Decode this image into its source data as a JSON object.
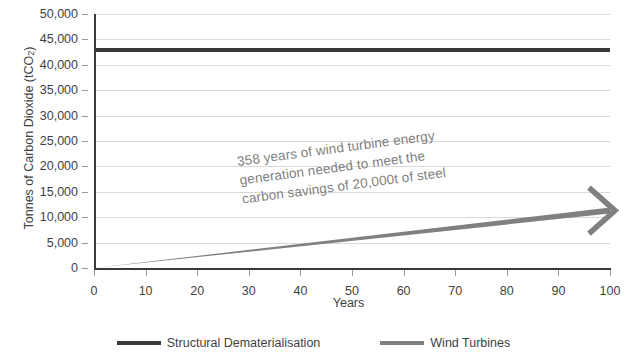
{
  "chart_data": {
    "type": "line",
    "title": "",
    "xlabel": "Years",
    "ylabel": "Tonnes of Carbon Dioxide (tCO2)",
    "ylabel_base": "Tonnes of Carbon Dioxide (tCO",
    "ylabel_sub": "2",
    "ylabel_tail": ")",
    "xlim": [
      0,
      100
    ],
    "ylim": [
      0,
      50000
    ],
    "grid": true,
    "legend_position": "bottom",
    "x_ticks": [
      "0",
      "10",
      "20",
      "30",
      "40",
      "50",
      "60",
      "70",
      "80",
      "90",
      "100"
    ],
    "x_tick_values": [
      0,
      10,
      20,
      30,
      40,
      50,
      60,
      70,
      80,
      90,
      100
    ],
    "y_ticks": [
      "0",
      "5,000",
      "10,000",
      "15,000",
      "20,000",
      "25,000",
      "30,000",
      "35,000",
      "40,000",
      "45,000",
      "50,000"
    ],
    "y_tick_values": [
      0,
      5000,
      10000,
      15000,
      20000,
      25000,
      30000,
      35000,
      40000,
      45000,
      50000
    ],
    "series": [
      {
        "name": "Structural Dematerialisation",
        "color": "#3a3a3a",
        "style": "constant-horizontal",
        "x": [
          0,
          100
        ],
        "values": [
          42900,
          42900
        ]
      },
      {
        "name": "Wind Turbines",
        "color": "#808080",
        "style": "linear-ramp-with-arrow",
        "x": [
          0,
          100
        ],
        "values": [
          0,
          11300
        ]
      }
    ],
    "annotations": [
      {
        "name": "years-needed-callout",
        "text": "358 years of wind turbine energy generation needed to meet the carbon savings of 20,000t of steel",
        "lines": [
          "358 years of wind turbine energy",
          "generation needed to meet the",
          "carbon savings of 20,000t of steel"
        ],
        "color": "#7f7f7f",
        "rotation_deg": -7.5
      }
    ]
  },
  "legend": {
    "items": [
      {
        "label": "Structural Dematerialisation",
        "color": "#3a3a3a"
      },
      {
        "label": "Wind Turbines",
        "color": "#808080"
      }
    ]
  },
  "colors": {
    "structural": "#3a3a3a",
    "wind": "#808080",
    "gridline": "#d9d9d9",
    "axis": "#3a3a3a",
    "text": "#3f3f3f",
    "annotation": "#7f7f7f",
    "background": "#ffffff"
  }
}
